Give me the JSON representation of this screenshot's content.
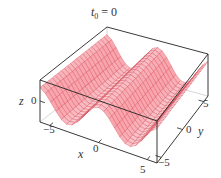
{
  "chart_data": {
    "type": "surface3d",
    "title": "t0 = 0",
    "title_var": "t",
    "title_sub": "0",
    "title_rest": " = 0",
    "xlabel": "x",
    "ylabel": "y",
    "zlabel": "z",
    "xticks": [
      "-5",
      "0",
      "5"
    ],
    "yticks": [
      "-5",
      "0",
      "5"
    ],
    "zticks": [
      "0"
    ],
    "xlim": [
      -6,
      6
    ],
    "ylim": [
      -6,
      6
    ],
    "zlim": [
      -1.5,
      1.5
    ],
    "function": "z = cos(x) (ridges parallel to y-axis)",
    "grid": {
      "nx": 22,
      "ny": 22
    },
    "colors": {
      "surface_fill": "#f7b8bd",
      "mesh_line": "#d9434f",
      "box": "#222222"
    },
    "box_on": true
  },
  "labels": {
    "title_t": "t",
    "title_sub": "0",
    "title_eq": " = 0",
    "x_axis": "x",
    "y_axis": "y",
    "z_axis": "z",
    "x_tick_neg": "−5",
    "x_tick_zero": "0",
    "x_tick_pos": "5",
    "y_tick_neg": "−5",
    "y_tick_zero": "0",
    "y_tick_pos": "5",
    "z_tick_zero": "0"
  }
}
